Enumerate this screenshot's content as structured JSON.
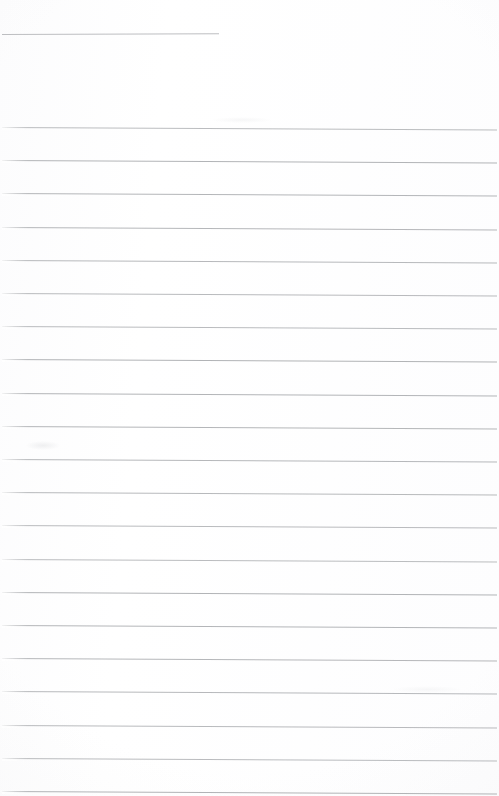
{
  "document": {
    "kind": "scanned-ruled-page",
    "title": "Blank ruled notebook page",
    "page_width": 499,
    "page_height": 796,
    "background_color": "#ffffff",
    "ink_color": "#b0b2b5",
    "header_rule_color": "#b9bbbe",
    "content_text": "",
    "visible_text": "",
    "header_rule": {
      "name": "header-rule",
      "x": 2,
      "y": 34,
      "width": 217,
      "thickness": 1,
      "slant_deg": -0.18
    },
    "ruling": {
      "line_count": 21,
      "first_line_y": 127,
      "spacing": 33.2,
      "left_margin": 2,
      "right_margin": 497,
      "thickness": 1,
      "slant_deg": 0.3,
      "lines_y": [
        127,
        160.2,
        193.4,
        226.6,
        259.8,
        293,
        326.2,
        359.4,
        392.6,
        425.8,
        459,
        492.2,
        525.4,
        558.6,
        591.8,
        625,
        658.2,
        691.4,
        724.6,
        757.8,
        791
      ]
    },
    "artifacts": [
      {
        "name": "scan-smudge-left",
        "x": 26,
        "y": 441,
        "width": 34,
        "height": 9,
        "opacity": 0.28
      },
      {
        "name": "scan-smudge-mid",
        "x": 212,
        "y": 117,
        "width": 60,
        "height": 6,
        "opacity": 0.16
      },
      {
        "name": "scan-smudge-lower",
        "x": 392,
        "y": 686,
        "width": 70,
        "height": 7,
        "opacity": 0.14
      }
    ]
  }
}
